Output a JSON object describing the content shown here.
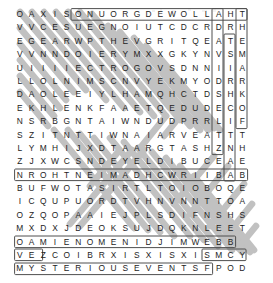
{
  "puzzle": {
    "type": "word-search",
    "columns": 21,
    "rows": 20,
    "grid": [
      "OAXISONUORGDEWOLLAHT",
      "VVCESUEGNOIUTCDCRDRH",
      "EGEARWPTHEVGRITQEATE",
      "VVNNDOIERYMXXGKYNVSM",
      "UIIIIECTROGOVSDNNIIA",
      "LLOLNIMSCNVYEKMYODRR",
      "DAOLEEIYLHAMQHCTDSHK",
      "EKHLENKFAAETQEDUDECO",
      "NSRBGNTAIWNDUDPRRLIF",
      "SZITNTTIWNAIARVEATTT",
      "LYMHIJXDTAARGTASHZNH",
      "ZJXWCSNDEYELDIBUCEAE",
      "NROHTNEIMADHCWRIIBAB",
      "BUFWOTASIRTLTOIOBOQE",
      "ICQUPUORDTVHNVNNTTOA",
      "OZQOPAAIEJPLSDIFNSHS",
      "MXDXJDEOKSUJDQKNLEET",
      "OAMIENOMENIDJIMWEBB",
      "VEZCOIBRXISXISXISMCY",
      "MYSTERIOUSEVENTSFPOD"
    ],
    "grid_rows": [
      {
        "index": 1,
        "letters": [
          "O",
          "A",
          "X",
          "I",
          "S",
          "O",
          "N",
          "U",
          "O",
          "R",
          "G",
          "D",
          "E",
          "W",
          "O",
          "L",
          "L",
          "A",
          "H",
          "T"
        ]
      },
      {
        "index": 2,
        "letters": [
          "V",
          "V",
          "C",
          "E",
          "S",
          "U",
          "E",
          "G",
          "N",
          "O",
          "I",
          "U",
          "T",
          "C",
          "D",
          "C",
          "R",
          "D",
          "R",
          "H"
        ]
      },
      {
        "index": 3,
        "letters": [
          "E",
          "G",
          "E",
          "A",
          "R",
          "W",
          "P",
          "T",
          "H",
          "E",
          "V",
          "G",
          "R",
          "I",
          "T",
          "Q",
          "E",
          "A",
          "T",
          "E"
        ]
      },
      {
        "index": 4,
        "letters": [
          "V",
          "V",
          "N",
          "N",
          "D",
          "O",
          "I",
          "E",
          "R",
          "Y",
          "M",
          "X",
          "X",
          "G",
          "K",
          "Y",
          "N",
          "V",
          "S",
          "M"
        ]
      },
      {
        "index": 5,
        "letters": [
          "U",
          "I",
          "I",
          "I",
          "I",
          "E",
          "C",
          "T",
          "R",
          "O",
          "G",
          "O",
          "V",
          "S",
          "D",
          "N",
          "N",
          "I",
          "I",
          "A"
        ]
      },
      {
        "index": 6,
        "letters": [
          "L",
          "L",
          "O",
          "L",
          "N",
          "I",
          "M",
          "S",
          "C",
          "N",
          "V",
          "Y",
          "E",
          "K",
          "M",
          "Y",
          "O",
          "D",
          "R",
          "R"
        ]
      },
      {
        "index": 7,
        "letters": [
          "D",
          "A",
          "O",
          "L",
          "E",
          "E",
          "I",
          "Y",
          "L",
          "H",
          "A",
          "M",
          "Q",
          "H",
          "C",
          "T",
          "D",
          "S",
          "H",
          "K"
        ]
      },
      {
        "index": 8,
        "letters": [
          "E",
          "K",
          "H",
          "L",
          "E",
          "N",
          "K",
          "F",
          "A",
          "A",
          "E",
          "T",
          "Q",
          "E",
          "D",
          "U",
          "D",
          "E",
          "C",
          "O"
        ]
      },
      {
        "index": 9,
        "letters": [
          "N",
          "S",
          "R",
          "B",
          "G",
          "N",
          "T",
          "A",
          "I",
          "W",
          "N",
          "D",
          "U",
          "D",
          "P",
          "R",
          "R",
          "L",
          "I",
          "F"
        ]
      },
      {
        "index": 10,
        "letters": [
          "S",
          "Z",
          "I",
          "T",
          "N",
          "T",
          "T",
          "I",
          "W",
          "N",
          "A",
          "I",
          "A",
          "R",
          "V",
          "E",
          "A",
          "T",
          "T",
          "T"
        ]
      },
      {
        "index": 11,
        "letters": [
          "L",
          "Y",
          "M",
          "H",
          "I",
          "J",
          "X",
          "D",
          "T",
          "A",
          "A",
          "R",
          "G",
          "T",
          "A",
          "S",
          "H",
          "Z",
          "N",
          "H"
        ]
      },
      {
        "index": 12,
        "letters": [
          "Z",
          "J",
          "X",
          "W",
          "C",
          "S",
          "N",
          "D",
          "E",
          "Y",
          "E",
          "L",
          "D",
          "I",
          "B",
          "U",
          "C",
          "E",
          "A",
          "E"
        ]
      },
      {
        "index": 13,
        "letters": [
          "N",
          "R",
          "O",
          "H",
          "T",
          "N",
          "E",
          "I",
          "M",
          "A",
          "D",
          "H",
          "C",
          "W",
          "R",
          "I",
          "I",
          "B",
          "A",
          "B"
        ]
      },
      {
        "index": 14,
        "letters": [
          "B",
          "U",
          "F",
          "W",
          "O",
          "T",
          "A",
          "S",
          "I",
          "R",
          "T",
          "L",
          "T",
          "O",
          "I",
          "O",
          "B",
          "O",
          "Q",
          "E"
        ]
      },
      {
        "index": 15,
        "letters": [
          "I",
          "C",
          "Q",
          "U",
          "P",
          "U",
          "O",
          "R",
          "D",
          "T",
          "V",
          "H",
          "N",
          "V",
          "N",
          "N",
          "T",
          "T",
          "O",
          "A"
        ]
      },
      {
        "index": 16,
        "letters": [
          "O",
          "Z",
          "Q",
          "O",
          "P",
          "A",
          "A",
          "I",
          "E",
          "J",
          "P",
          "L",
          "S",
          "D",
          "I",
          "F",
          "N",
          "S",
          "H",
          "S"
        ]
      },
      {
        "index": 17,
        "letters": [
          "M",
          "X",
          "D",
          "X",
          "J",
          "D",
          "E",
          "O",
          "K",
          "S",
          "U",
          "J",
          "D",
          "Q",
          "K",
          "N",
          "L",
          "E",
          "E",
          "T"
        ]
      },
      {
        "index": 18,
        "letters": [
          "O",
          "A",
          "M",
          "I",
          "E",
          "N",
          "O",
          "M",
          "E",
          "N",
          "I",
          "D",
          "J",
          "I",
          "M",
          "W",
          "E",
          "B",
          "B"
        ]
      },
      {
        "index": 19,
        "letters": [
          "V",
          "E",
          "Z",
          "C",
          "O",
          "I",
          "B",
          "R",
          "X",
          "I",
          "S",
          "X",
          "I",
          "S",
          "X",
          "I",
          "S",
          "M",
          "C",
          "Y"
        ]
      },
      {
        "index": 20,
        "letters": [
          "M",
          "Y",
          "S",
          "T",
          "E",
          "R",
          "I",
          "O",
          "U",
          "S",
          "E",
          "V",
          "E",
          "N",
          "T",
          "S",
          "F",
          "P",
          "O",
          "D"
        ]
      }
    ],
    "colors": {
      "letter": "#1d1d1d",
      "highlight_stroke": "#b8b8b8",
      "box_stroke": "#4a4a4a",
      "background": "#ffffff"
    }
  }
}
